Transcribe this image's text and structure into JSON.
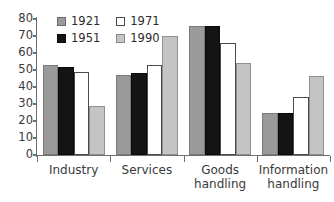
{
  "chart_data": {
    "type": "bar",
    "title": "",
    "subtitle": "",
    "xlabel": "",
    "ylabel": "",
    "ylim": [
      0,
      80
    ],
    "ytick_step": 10,
    "yticks": [
      0,
      10,
      20,
      30,
      40,
      50,
      60,
      70,
      80
    ],
    "ytick_labels": [
      "0",
      "10",
      "20",
      "30",
      "40",
      "50",
      "60",
      "70",
      "80"
    ],
    "grid": false,
    "legend_position": "top-left-inside",
    "categories": [
      "Industry",
      "Services",
      "Goods handling",
      "Information handling"
    ],
    "category_lines": [
      [
        "Industry"
      ],
      [
        "Services"
      ],
      [
        "Goods",
        "handling"
      ],
      [
        "Information",
        "handling"
      ]
    ],
    "series": [
      {
        "name": "1921",
        "color": "#9a9a9a",
        "values": [
          53,
          47,
          76,
          24.5
        ]
      },
      {
        "name": "1951",
        "color": "#141414",
        "values": [
          52,
          48,
          76,
          24.5
        ]
      },
      {
        "name": "1971",
        "color": "#ffffff",
        "values": [
          49,
          53,
          66,
          34
        ]
      },
      {
        "name": "1990",
        "color": "#c4c4c4",
        "values": [
          29,
          70,
          54,
          46.5
        ]
      }
    ]
  },
  "legend": {
    "entries": [
      {
        "label": "1921",
        "swatch": "medium-gray"
      },
      {
        "label": "1971",
        "swatch": "white"
      },
      {
        "label": "1951",
        "swatch": "black"
      },
      {
        "label": "1990",
        "swatch": "light-gray"
      }
    ]
  },
  "colors": {
    "series_1921": "#9a9a9a",
    "series_1951": "#141414",
    "series_1971": "#ffffff",
    "series_1990": "#c4c4c4",
    "axis": "#6f6f6f",
    "text": "#2b2b2b",
    "background": "#ffffff"
  }
}
